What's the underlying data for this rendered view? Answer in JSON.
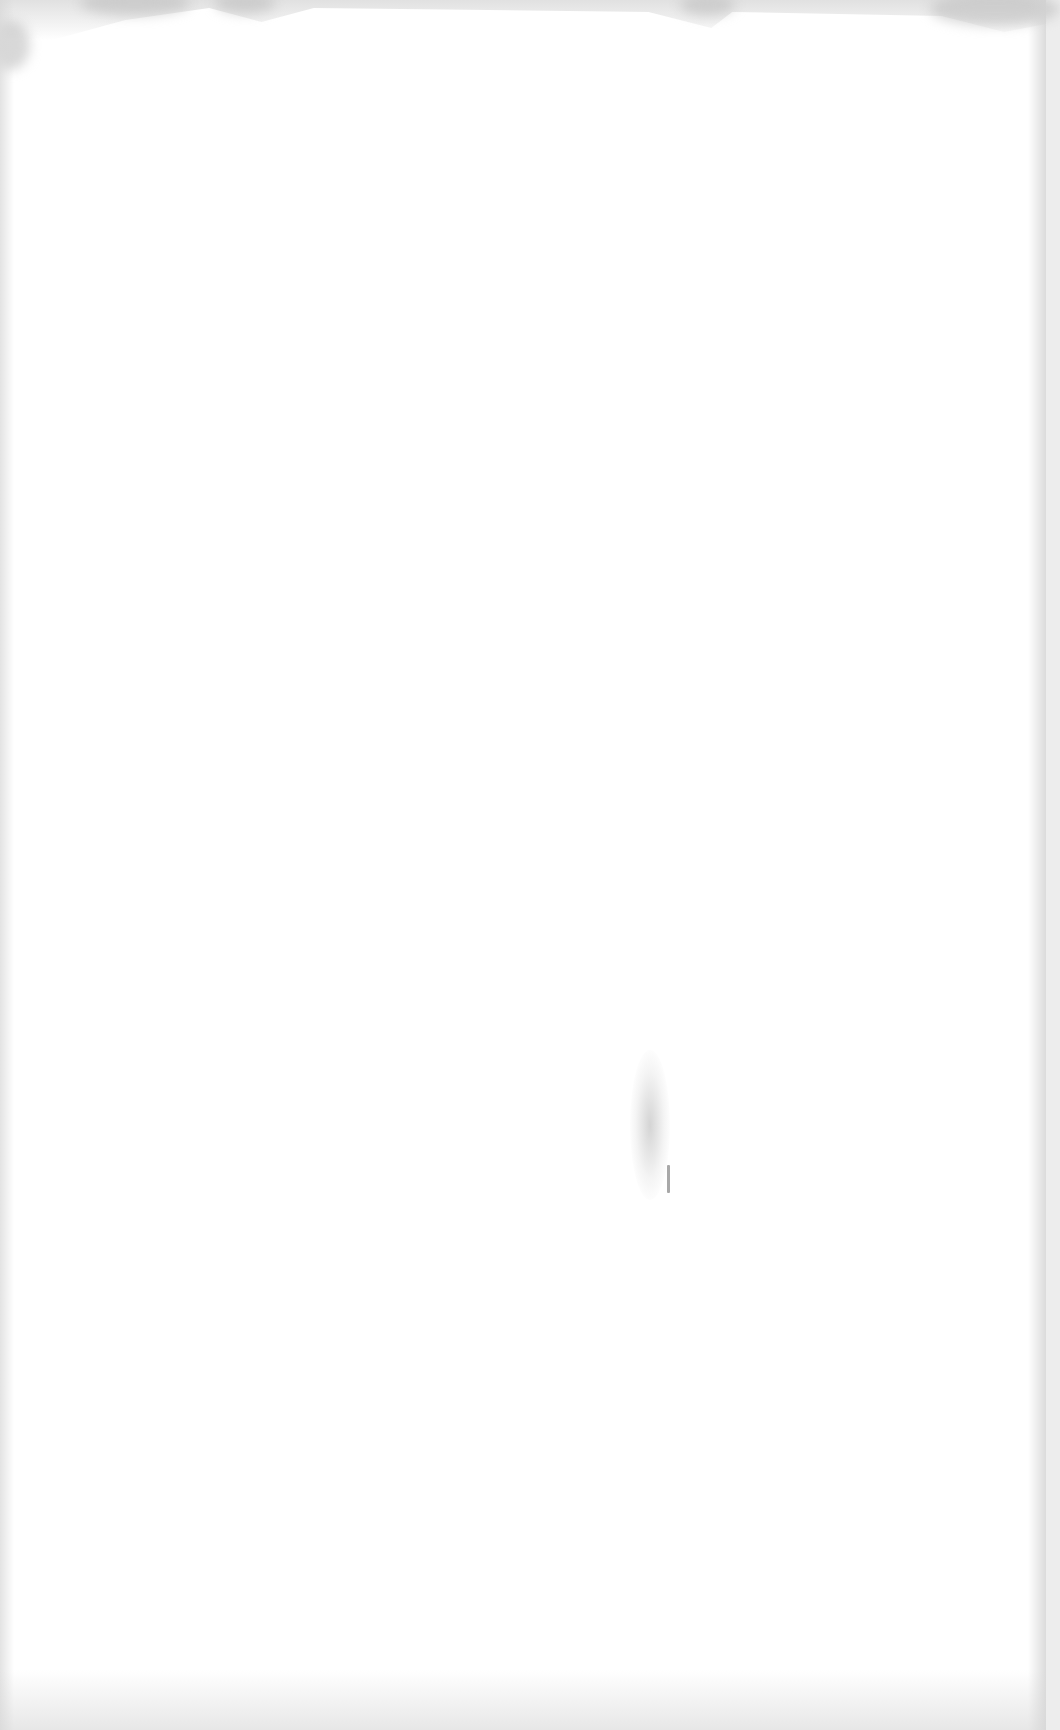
{
  "document": {
    "type": "scanned-page",
    "content": "",
    "background_color": "#ffffff",
    "edge_shadow_color": "#d2d2d2",
    "marks": [
      {
        "kind": "smudge",
        "approx_x": 650,
        "approx_y": 1125
      }
    ]
  }
}
